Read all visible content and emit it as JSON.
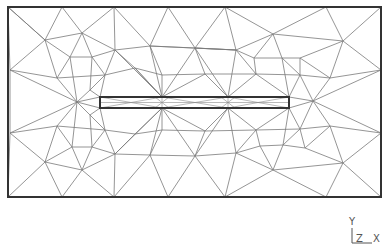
{
  "diagram": {
    "type": "finite-element-mesh",
    "colors": {
      "mesh": "#7a7a7a",
      "border": "#333333",
      "axis": "#555555",
      "background": "#ffffff"
    },
    "domain_rect": {
      "x1": 8,
      "y1": 7,
      "x2": 381,
      "y2": 197
    },
    "crack_rect": {
      "x1": 100,
      "y1": 97,
      "x2": 289,
      "y2": 108
    },
    "crack_refinement_nodes_x": [
      100,
      162,
      228,
      289
    ]
  },
  "axes": {
    "y_label": "Y",
    "z_label": "Z",
    "x_label": "X"
  }
}
